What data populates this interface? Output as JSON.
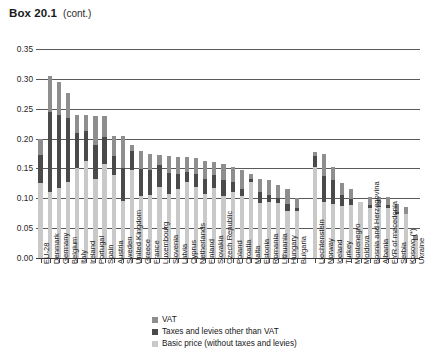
{
  "header": {
    "box_label": "Box 20.1",
    "cont_label": "(cont.)"
  },
  "legend": {
    "items": [
      {
        "label": "VAT",
        "color": "#8e8e8e",
        "key": "vat"
      },
      {
        "label": "Taxes and levies other than VAT",
        "color": "#4a4a4a",
        "key": "other"
      },
      {
        "label": "Basic price (without taxes and levies)",
        "color": "#c9c9c9",
        "key": "basic"
      }
    ]
  },
  "chart_data": {
    "type": "bar",
    "title": "Box 20.1 (cont.)",
    "xlabel": "",
    "ylabel": "",
    "ylim": [
      0.0,
      0.35
    ],
    "ytick_labels": [
      "0.00",
      "0.05",
      "0.10",
      "0.15",
      "0.20",
      "0.25",
      "0.30",
      "0.35"
    ],
    "ytick_values": [
      0.0,
      0.05,
      0.1,
      0.15,
      0.2,
      0.25,
      0.3,
      0.35
    ],
    "grid": true,
    "stacked": true,
    "legend_position": "bottom",
    "series": [
      {
        "name": "Basic price (without taxes and levies)",
        "key": "basic",
        "color": "#c9c9c9"
      },
      {
        "name": "Taxes and levies other than VAT",
        "key": "other",
        "color": "#4a4a4a"
      },
      {
        "name": "VAT",
        "key": "vat",
        "color": "#8e8e8e"
      }
    ],
    "categories": [
      "EU-28",
      "Denmark",
      "Germany",
      "Belgium",
      "Italy",
      "Ireland",
      "Portugal",
      "Spain",
      "Austria",
      "Sweden",
      "United Kingdom",
      "Greece",
      "France",
      "Luxembourg",
      "Slovenia",
      "Latvia",
      "Cyprus",
      "Netherlands",
      "Finland",
      "Slovakia",
      "Czech Republic",
      "Poland",
      "Croatia",
      "Malta",
      "Estonia",
      "Romania",
      "Lithuania",
      "Hungary",
      "Bulgaria",
      "Liechtenstein",
      "Norway",
      "Iceland",
      "Turkey",
      "Montenegro",
      "Moldova",
      "Bosnia and Herzegovina",
      "Albania",
      "FYR of macedonia",
      "Serbia",
      "Kosovo (*)",
      "Ukraine"
    ],
    "gap_after_index": 28,
    "bars": [
      {
        "category": "EU-28",
        "basic": 0.126,
        "other": 0.047,
        "vat": 0.027,
        "total": 0.2
      },
      {
        "category": "Denmark",
        "basic": 0.111,
        "other": 0.133,
        "vat": 0.061,
        "total": 0.305
      },
      {
        "category": "Germany",
        "basic": 0.117,
        "other": 0.123,
        "vat": 0.055,
        "total": 0.295
      },
      {
        "category": "Belgium",
        "basic": 0.128,
        "other": 0.106,
        "vat": 0.042,
        "total": 0.276
      },
      {
        "category": "Italy",
        "basic": 0.15,
        "other": 0.06,
        "vat": 0.03,
        "total": 0.24
      },
      {
        "category": "Ireland",
        "basic": 0.163,
        "other": 0.05,
        "vat": 0.027,
        "total": 0.24
      },
      {
        "category": "Portugal",
        "basic": 0.133,
        "other": 0.057,
        "vat": 0.048,
        "total": 0.238
      },
      {
        "category": "Spain",
        "basic": 0.158,
        "other": 0.044,
        "vat": 0.036,
        "total": 0.238
      },
      {
        "category": "Austria",
        "basic": 0.139,
        "other": 0.032,
        "vat": 0.034,
        "total": 0.205
      },
      {
        "category": "Sweden",
        "basic": 0.095,
        "other": 0.055,
        "vat": 0.055,
        "total": 0.205
      },
      {
        "category": "United Kingdom",
        "basic": 0.147,
        "other": 0.033,
        "vat": 0.009,
        "total": 0.189
      },
      {
        "category": "Greece",
        "basic": 0.104,
        "other": 0.045,
        "vat": 0.031,
        "total": 0.18
      },
      {
        "category": "France",
        "basic": 0.106,
        "other": 0.041,
        "vat": 0.027,
        "total": 0.174
      },
      {
        "category": "Luxembourg",
        "basic": 0.119,
        "other": 0.036,
        "vat": 0.018,
        "total": 0.173
      },
      {
        "category": "Slovenia",
        "basic": 0.107,
        "other": 0.036,
        "vat": 0.028,
        "total": 0.171
      },
      {
        "category": "Latvia",
        "basic": 0.116,
        "other": 0.024,
        "vat": 0.029,
        "total": 0.169
      },
      {
        "category": "Cyprus",
        "basic": 0.127,
        "other": 0.017,
        "vat": 0.025,
        "total": 0.169
      },
      {
        "category": "Netherlands",
        "basic": 0.119,
        "other": 0.022,
        "vat": 0.027,
        "total": 0.168
      },
      {
        "category": "Finland",
        "basic": 0.108,
        "other": 0.025,
        "vat": 0.029,
        "total": 0.162
      },
      {
        "category": "Slovakia",
        "basic": 0.117,
        "other": 0.022,
        "vat": 0.021,
        "total": 0.16
      },
      {
        "category": "Czech Republic",
        "basic": 0.104,
        "other": 0.027,
        "vat": 0.026,
        "total": 0.157
      },
      {
        "category": "Poland",
        "basic": 0.11,
        "other": 0.017,
        "vat": 0.026,
        "total": 0.153
      },
      {
        "category": "Croatia",
        "basic": 0.104,
        "other": 0.012,
        "vat": 0.031,
        "total": 0.147
      },
      {
        "category": "Malta",
        "basic": 0.128,
        "other": 0.004,
        "vat": 0.008,
        "total": 0.14
      },
      {
        "category": "Estonia",
        "basic": 0.092,
        "other": 0.018,
        "vat": 0.022,
        "total": 0.132
      },
      {
        "category": "Romania",
        "basic": 0.094,
        "other": 0.011,
        "vat": 0.025,
        "total": 0.13
      },
      {
        "category": "Lithuania",
        "basic": 0.092,
        "other": 0.009,
        "vat": 0.022,
        "total": 0.123
      },
      {
        "category": "Hungary",
        "basic": 0.079,
        "other": 0.012,
        "vat": 0.025,
        "total": 0.116
      },
      {
        "category": "Bulgaria",
        "basic": 0.078,
        "other": 0.006,
        "vat": 0.016,
        "total": 0.1
      },
      {
        "category": "Liechtenstein",
        "basic": 0.153,
        "other": 0.018,
        "vat": 0.006,
        "total": 0.177
      },
      {
        "category": "Norway",
        "basic": 0.094,
        "other": 0.044,
        "vat": 0.036,
        "total": 0.174
      },
      {
        "category": "Iceland",
        "basic": 0.091,
        "other": 0.04,
        "vat": 0.022,
        "total": 0.153
      },
      {
        "category": "Turkey",
        "basic": 0.087,
        "other": 0.018,
        "vat": 0.02,
        "total": 0.125
      },
      {
        "category": "Montenegro",
        "basic": 0.088,
        "other": 0.01,
        "vat": 0.017,
        "total": 0.115
      },
      {
        "category": "Moldova",
        "basic": 0.094,
        "other": 0.0,
        "vat": 0.0,
        "total": 0.094
      },
      {
        "category": "Bosnia and Herzegovina",
        "basic": 0.083,
        "other": 0.006,
        "vat": 0.014,
        "total": 0.103
      },
      {
        "category": "Albania",
        "basic": 0.085,
        "other": 0.002,
        "vat": 0.016,
        "total": 0.103
      },
      {
        "category": "FYR of macedonia",
        "basic": 0.084,
        "other": 0.004,
        "vat": 0.014,
        "total": 0.102
      },
      {
        "category": "Serbia",
        "basic": 0.074,
        "other": 0.003,
        "vat": 0.014,
        "total": 0.091
      },
      {
        "category": "Kosovo (*)",
        "basic": 0.073,
        "other": 0.0,
        "vat": 0.013,
        "total": 0.086
      },
      {
        "category": "Ukraine",
        "basic": 0.03,
        "other": 0.002,
        "vat": 0.006,
        "total": 0.038
      }
    ]
  }
}
